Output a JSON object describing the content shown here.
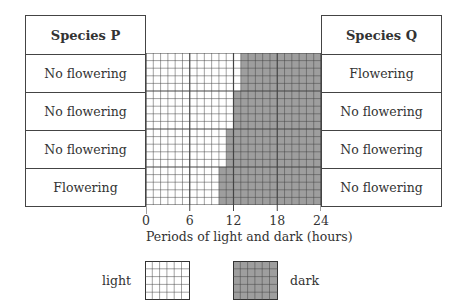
{
  "species_p": {
    "header": "Species P",
    "rows": [
      "No flowering",
      "No flowering",
      "No flowering",
      "Flowering"
    ]
  },
  "species_q": {
    "header": "Species Q",
    "rows": [
      "Flowering",
      "No flowering",
      "No flowering",
      "No flowering"
    ]
  },
  "axis": {
    "ticks": [
      "0",
      "6",
      "12",
      "18",
      "24"
    ],
    "title": "Periods of light and dark (hours)"
  },
  "legend": {
    "light_label": "light",
    "dark_label": "dark"
  },
  "colors": {
    "light_fill": "#ffffff",
    "dark_fill": "#9e9e9e",
    "grid_line": "#444444"
  },
  "chart_data": {
    "type": "bar",
    "title": "",
    "xlabel": "Periods of light and dark (hours)",
    "xlim": [
      0,
      24
    ],
    "x_ticks": [
      0,
      6,
      12,
      18,
      24
    ],
    "categories": [
      "Row 1",
      "Row 2",
      "Row 3",
      "Row 4"
    ],
    "series": [
      {
        "name": "light",
        "values": [
          13,
          12,
          11,
          10
        ]
      },
      {
        "name": "dark",
        "values": [
          11,
          12,
          13,
          14
        ]
      }
    ],
    "species_p_response": [
      "No flowering",
      "No flowering",
      "No flowering",
      "Flowering"
    ],
    "species_q_response": [
      "Flowering",
      "No flowering",
      "No flowering",
      "No flowering"
    ]
  }
}
